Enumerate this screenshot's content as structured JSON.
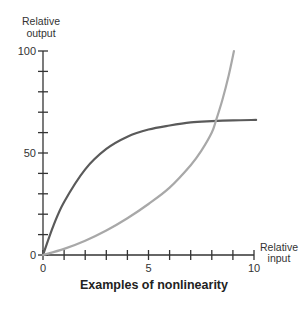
{
  "chart_data": {
    "type": "line",
    "title": "Examples of nonlinearity",
    "xlabel": "Relative input",
    "ylabel": "Relative output",
    "xlim": [
      0,
      10
    ],
    "ylim": [
      0,
      100
    ],
    "x_ticks": [
      0,
      5,
      10
    ],
    "y_ticks": [
      0,
      50,
      100
    ],
    "x_minor_ticks_step": 1,
    "y_minor_ticks_step": 10,
    "grid": false,
    "legend": null,
    "series": [
      {
        "name": "saturating (concave) curve",
        "color": "#5a5a5a",
        "x": [
          0,
          0.5,
          1,
          2,
          3,
          4,
          5,
          6,
          7,
          8,
          9,
          10.1
        ],
        "y": [
          0,
          14.5,
          26,
          42,
          52,
          58,
          61.5,
          63.5,
          65,
          65.6,
          66,
          66.2
        ]
      },
      {
        "name": "accelerating (convex) curve",
        "color": "#a8a8a8",
        "x": [
          0,
          1,
          2,
          3,
          4,
          5,
          6,
          7,
          7.5,
          8,
          8.2,
          8.5,
          8.8,
          9.05
        ],
        "y": [
          0,
          3,
          7,
          12,
          18,
          25,
          33,
          44,
          51,
          60,
          66,
          76,
          88,
          100
        ]
      }
    ]
  },
  "labels": {
    "ylabel_line1": "Relative",
    "ylabel_line2": "output",
    "xlabel_line1": "Relative",
    "xlabel_line2": "input",
    "y_tick_0": "0",
    "y_tick_50": "50",
    "y_tick_100": "100",
    "x_tick_0": "0",
    "x_tick_5": "5",
    "x_tick_10": "10",
    "title": "Examples of nonlinearity"
  }
}
